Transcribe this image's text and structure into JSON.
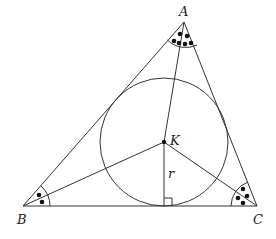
{
  "diagram": {
    "labels": {
      "A": "A",
      "B": "B",
      "C": "C",
      "K": "K",
      "r": "r"
    },
    "points": {
      "A": [
        184,
        22
      ],
      "B": [
        23,
        206
      ],
      "C": [
        257,
        206
      ],
      "K": [
        164,
        142
      ]
    },
    "incircle": {
      "center": [
        164,
        142
      ],
      "radius": 64
    },
    "angle_marks": {
      "A": {
        "dots_per_half": 3
      },
      "B": {
        "dots_per_half": 1
      },
      "C": {
        "dots_per_half": 2
      }
    },
    "right_angle_marker": "at foot of r on BC"
  }
}
